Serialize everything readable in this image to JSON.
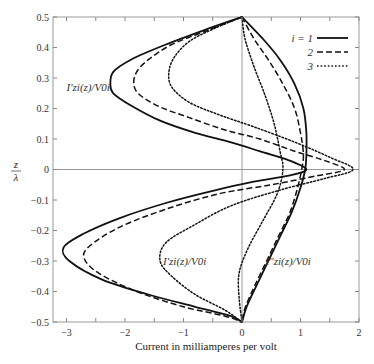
{
  "chart_data": {
    "type": "line",
    "title": "",
    "xlabel": "Current in milliamperes per volt",
    "ylabel": "z/λ",
    "xlim": [
      -3.25,
      2
    ],
    "ylim": [
      -0.5,
      0.5
    ],
    "x_ticks": [
      -3,
      -2,
      -1,
      0,
      1,
      2
    ],
    "x_tick_labels": [
      "−3",
      "−2",
      "−1",
      "0",
      "1",
      "2"
    ],
    "y_ticks": [
      -0.5,
      -0.4,
      -0.3,
      -0.2,
      -0.1,
      0,
      0.1,
      0.2,
      0.3,
      0.4,
      0.5
    ],
    "y_tick_labels": [
      "−0.5",
      "−0.4",
      "−0.3",
      "−0.2",
      "−0.1",
      "0",
      "0.1",
      "0.2",
      "0.3",
      "0.4",
      "0.5"
    ],
    "grid": false,
    "reference_lines": {
      "x": 0,
      "y": 0
    },
    "legend": {
      "position": "top-right",
      "entries": [
        {
          "label": "i = 1",
          "style": "solid"
        },
        {
          "label": "2",
          "style": "dashed"
        },
        {
          "label": "3",
          "style": "dotted"
        }
      ]
    },
    "annotations": [
      {
        "text": "I′zi(z)/V0i",
        "near": "upper-left, beside i=1 curve",
        "position_data": [
          -3.0,
          0.27
        ]
      },
      {
        "text": "I′zi(z)/V0i",
        "near": "lower-middle",
        "position_data": [
          -1.35,
          -0.3
        ]
      },
      {
        "text": "I″zi(z)/V0i",
        "near": "lower-right",
        "position_data": [
          0.4,
          -0.3
        ]
      }
    ],
    "series": [
      {
        "name": "I'zi/V0i, i=1",
        "style": "solid",
        "points": [
          [
            0,
            0.5
          ],
          [
            -0.6,
            0.46
          ],
          [
            -1.3,
            0.41
          ],
          [
            -1.9,
            0.36
          ],
          [
            -2.2,
            0.32
          ],
          [
            -2.25,
            0.28
          ],
          [
            -2.2,
            0.25
          ],
          [
            -1.9,
            0.21
          ],
          [
            -1.4,
            0.16
          ],
          [
            -0.8,
            0.12
          ],
          [
            -0.2,
            0.09
          ],
          [
            0.3,
            0.06
          ],
          [
            0.8,
            0.03
          ],
          [
            1.1,
            0.0
          ],
          [
            0.8,
            -0.02
          ],
          [
            0.2,
            -0.04
          ],
          [
            -0.5,
            -0.07
          ],
          [
            -1.3,
            -0.11
          ],
          [
            -2.1,
            -0.16
          ],
          [
            -2.7,
            -0.21
          ],
          [
            -3.05,
            -0.255
          ],
          [
            -2.95,
            -0.3
          ],
          [
            -2.4,
            -0.36
          ],
          [
            -1.6,
            -0.41
          ],
          [
            -0.8,
            -0.45
          ],
          [
            -0.2,
            -0.48
          ],
          [
            0,
            -0.5
          ]
        ]
      },
      {
        "name": "I'zi/V0i, i=2",
        "style": "dashed",
        "points": [
          [
            0,
            0.5
          ],
          [
            -0.6,
            0.455
          ],
          [
            -1.2,
            0.41
          ],
          [
            -1.6,
            0.36
          ],
          [
            -1.8,
            0.32
          ],
          [
            -1.85,
            0.28
          ],
          [
            -1.75,
            0.245
          ],
          [
            -1.4,
            0.205
          ],
          [
            -0.9,
            0.17
          ],
          [
            -0.3,
            0.13
          ],
          [
            0.3,
            0.1
          ],
          [
            0.9,
            0.06
          ],
          [
            1.4,
            0.03
          ],
          [
            1.75,
            0.0
          ],
          [
            1.3,
            -0.02
          ],
          [
            0.5,
            -0.05
          ],
          [
            -0.4,
            -0.08
          ],
          [
            -1.3,
            -0.13
          ],
          [
            -2.1,
            -0.19
          ],
          [
            -2.6,
            -0.25
          ],
          [
            -2.7,
            -0.29
          ],
          [
            -2.45,
            -0.34
          ],
          [
            -1.8,
            -0.4
          ],
          [
            -1.0,
            -0.45
          ],
          [
            -0.3,
            -0.48
          ],
          [
            0,
            -0.5
          ]
        ]
      },
      {
        "name": "I'zi/V0i, i=3",
        "style": "dotted",
        "points": [
          [
            0,
            0.5
          ],
          [
            -0.5,
            0.46
          ],
          [
            -0.9,
            0.42
          ],
          [
            -1.15,
            0.37
          ],
          [
            -1.25,
            0.32
          ],
          [
            -1.2,
            0.27
          ],
          [
            -0.9,
            0.22
          ],
          [
            -0.4,
            0.18
          ],
          [
            0.2,
            0.14
          ],
          [
            0.9,
            0.09
          ],
          [
            1.5,
            0.04
          ],
          [
            1.9,
            0.0
          ],
          [
            1.4,
            -0.03
          ],
          [
            0.6,
            -0.07
          ],
          [
            -0.2,
            -0.12
          ],
          [
            -0.8,
            -0.18
          ],
          [
            -1.3,
            -0.24
          ],
          [
            -1.4,
            -0.3
          ],
          [
            -1.2,
            -0.35
          ],
          [
            -0.8,
            -0.41
          ],
          [
            -0.3,
            -0.46
          ],
          [
            0,
            -0.5
          ]
        ]
      },
      {
        "name": "I''zi/V0i, i=1",
        "style": "solid",
        "points": [
          [
            0,
            0.5
          ],
          [
            0.35,
            0.43
          ],
          [
            0.65,
            0.36
          ],
          [
            0.9,
            0.28
          ],
          [
            1.05,
            0.2
          ],
          [
            1.1,
            0.12
          ],
          [
            1.1,
            0.05
          ],
          [
            1.08,
            0.0
          ],
          [
            1.0,
            -0.06
          ],
          [
            0.85,
            -0.14
          ],
          [
            0.65,
            -0.22
          ],
          [
            0.45,
            -0.3
          ],
          [
            0.25,
            -0.38
          ],
          [
            0.08,
            -0.45
          ],
          [
            0,
            -0.5
          ]
        ]
      },
      {
        "name": "I''zi/V0i, i=2",
        "style": "dashed",
        "points": [
          [
            0,
            0.5
          ],
          [
            0.2,
            0.43
          ],
          [
            0.45,
            0.36
          ],
          [
            0.7,
            0.28
          ],
          [
            0.9,
            0.2
          ],
          [
            1.0,
            0.12
          ],
          [
            1.05,
            0.05
          ],
          [
            1.02,
            0.0
          ],
          [
            0.95,
            -0.06
          ],
          [
            0.82,
            -0.14
          ],
          [
            0.62,
            -0.22
          ],
          [
            0.42,
            -0.3
          ],
          [
            0.22,
            -0.38
          ],
          [
            0.06,
            -0.45
          ],
          [
            0,
            -0.5
          ]
        ]
      },
      {
        "name": "I''zi/V0i, i=3",
        "style": "dotted",
        "points": [
          [
            0,
            0.5
          ],
          [
            0.05,
            0.43
          ],
          [
            0.2,
            0.34
          ],
          [
            0.4,
            0.24
          ],
          [
            0.55,
            0.15
          ],
          [
            0.65,
            0.06
          ],
          [
            0.7,
            0.0
          ],
          [
            0.6,
            -0.08
          ],
          [
            0.35,
            -0.17
          ],
          [
            0.1,
            -0.26
          ],
          [
            -0.05,
            -0.34
          ],
          [
            -0.05,
            -0.42
          ],
          [
            0,
            -0.5
          ]
        ]
      }
    ]
  }
}
